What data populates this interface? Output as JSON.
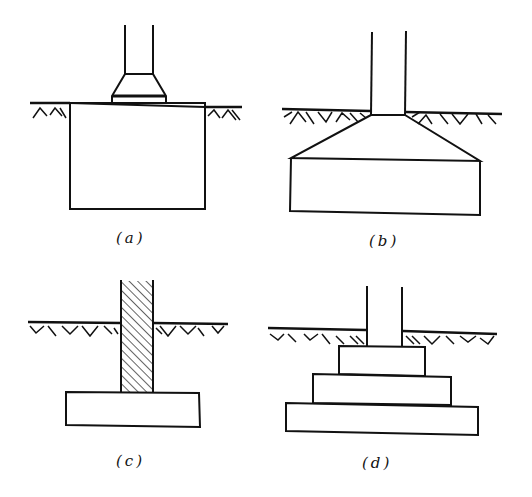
{
  "figure": {
    "panels": [
      {
        "id": "a",
        "label": "(a)",
        "description": "Column on pedestal cap over deep block footing"
      },
      {
        "id": "b",
        "label": "(b)",
        "description": "Column on sloped (tapered) footing"
      },
      {
        "id": "c",
        "label": "(c)",
        "description": "Hatched wall/column on flat slab footing"
      },
      {
        "id": "d",
        "label": "(d)",
        "description": "Column on stepped footing with three tiers"
      }
    ]
  },
  "colors": {
    "ink": "#111111",
    "background": "#ffffff"
  }
}
